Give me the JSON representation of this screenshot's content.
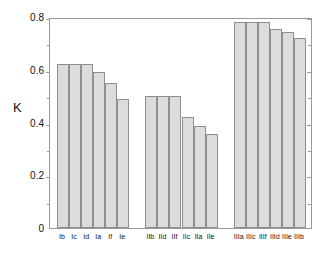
{
  "chart_data": {
    "type": "bar",
    "title": "",
    "xlabel": "",
    "ylabel": "K",
    "ylim": [
      0,
      0.8
    ],
    "grid": false,
    "legend": null,
    "y_ticks": [
      0,
      0.2,
      0.4,
      0.6,
      0.8
    ],
    "y_tick_labels": [
      "0",
      "0.2",
      "0.4",
      "0.6",
      "0.8"
    ],
    "y_minor_ticks": [
      0.1,
      0.3,
      0.5,
      0.7
    ],
    "categories": [
      "Ib",
      "Ic",
      "Id",
      "Ia",
      "If",
      "Ie",
      "IIb",
      "IId",
      "IIf",
      "IIc",
      "IIa",
      "IIe",
      "IIIa",
      "IIIc",
      "IIIf",
      "IIId",
      "IIIe",
      "IIIb"
    ],
    "values": [
      0.62,
      0.62,
      0.62,
      0.59,
      0.55,
      0.49,
      0.5,
      0.5,
      0.5,
      0.42,
      0.385,
      0.355,
      0.78,
      0.78,
      0.78,
      0.755,
      0.745,
      0.72
    ],
    "groups": [
      {
        "name": "I",
        "categories": [
          "Ib",
          "Ic",
          "Id",
          "Ia",
          "If",
          "Ie"
        ],
        "values": [
          0.62,
          0.62,
          0.62,
          0.59,
          0.55,
          0.49
        ]
      },
      {
        "name": "II",
        "categories": [
          "IIb",
          "IId",
          "IIf",
          "IIc",
          "IIa",
          "IIe"
        ],
        "values": [
          0.5,
          0.5,
          0.5,
          0.42,
          0.385,
          0.355
        ]
      },
      {
        "name": "III",
        "categories": [
          "IIIa",
          "IIIc",
          "IIIf",
          "IIId",
          "IIIe",
          "IIIb"
        ],
        "values": [
          0.78,
          0.78,
          0.78,
          0.755,
          0.745,
          0.72
        ]
      }
    ],
    "colors": {
      "bar_fill": "#dcdcdc",
      "bar_stroke": "#8f8f8f",
      "axis": "#9a9a9a",
      "text": "#111111",
      "background": "#ffffff"
    }
  }
}
